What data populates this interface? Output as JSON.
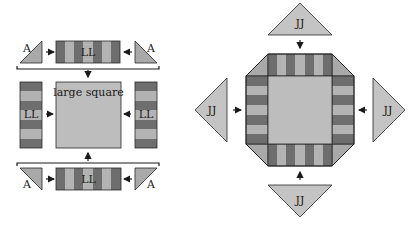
{
  "colors": {
    "dark_stripe": "#6e6e6e",
    "light_stripe": "#b3b3b3",
    "square_fill": "#bdbdbd",
    "triangle_fill": "#a9a9a9",
    "jj_fill": "#c4c4c4",
    "outline": "#2a2a2a"
  },
  "left_diagram": {
    "title": "Block assembly (rows)",
    "top_row": {
      "left_triangle": "A",
      "strip": "LL",
      "right_triangle": "A"
    },
    "middle_row": {
      "left_strip": "LL",
      "center": "large square",
      "right_strip": "LL"
    },
    "bottom_row": {
      "left_triangle": "A",
      "strip": "LL",
      "right_triangle": "A"
    }
  },
  "right_diagram": {
    "title": "Corner triangle assembly",
    "top_triangle": "JJ",
    "left_triangle": "JJ",
    "right_triangle": "JJ",
    "bottom_triangle": "JJ"
  }
}
